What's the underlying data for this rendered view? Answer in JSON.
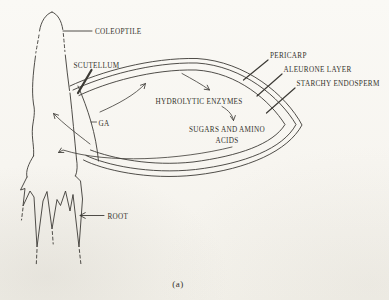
{
  "figure": {
    "caption": "(a)",
    "colors": {
      "paper": "#f7f5f0",
      "ink": "#3c3a35",
      "text": "#34322c"
    },
    "labels": {
      "coleoptile": "COLEOPTILE",
      "scutellum": "SCUTELLUM",
      "pericarp": "PERICARP",
      "aleurone_layer": "ALEURONE LAYER",
      "starchy_endosperm": "STARCHY ENDOSPERM",
      "hydrolytic_enzymes": "HYDROLYTIC ENZYMES",
      "ga": "GA",
      "sugars_amino_line1": "SUGARS AND AMINO",
      "sugars_amino_line2": "ACIDS",
      "root": "ROOT"
    }
  }
}
